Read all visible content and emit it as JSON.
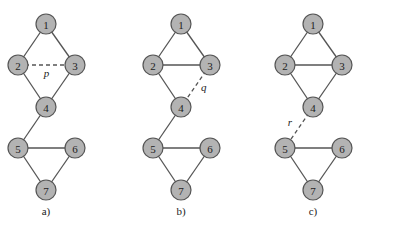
{
  "panels": [
    {
      "label": "a)",
      "offset_x": 0,
      "edges": [
        {
          "from": "1",
          "to": "2",
          "style": "solid"
        },
        {
          "from": "1",
          "to": "3",
          "style": "solid"
        },
        {
          "from": "2",
          "to": "3",
          "style": "dashed",
          "label": "p"
        },
        {
          "from": "2",
          "to": "4",
          "style": "solid"
        },
        {
          "from": "3",
          "to": "4",
          "style": "solid"
        },
        {
          "from": "4",
          "to": "5",
          "style": "solid"
        },
        {
          "from": "5",
          "to": "6",
          "style": "solid"
        },
        {
          "from": "5",
          "to": "7",
          "style": "solid"
        },
        {
          "from": "6",
          "to": "7",
          "style": "solid"
        }
      ]
    },
    {
      "label": "b)",
      "offset_x": 135,
      "edges": [
        {
          "from": "1",
          "to": "2",
          "style": "solid"
        },
        {
          "from": "1",
          "to": "3",
          "style": "solid"
        },
        {
          "from": "2",
          "to": "3",
          "style": "solid"
        },
        {
          "from": "2",
          "to": "4",
          "style": "solid"
        },
        {
          "from": "3",
          "to": "4",
          "style": "dashed",
          "label": "q"
        },
        {
          "from": "4",
          "to": "5",
          "style": "solid"
        },
        {
          "from": "5",
          "to": "6",
          "style": "solid"
        },
        {
          "from": "5",
          "to": "7",
          "style": "solid"
        },
        {
          "from": "6",
          "to": "7",
          "style": "solid"
        }
      ]
    },
    {
      "label": "c)",
      "offset_x": 267,
      "edges": [
        {
          "from": "1",
          "to": "2",
          "style": "solid"
        },
        {
          "from": "1",
          "to": "3",
          "style": "solid"
        },
        {
          "from": "2",
          "to": "3",
          "style": "solid"
        },
        {
          "from": "2",
          "to": "4",
          "style": "solid"
        },
        {
          "from": "3",
          "to": "4",
          "style": "solid"
        },
        {
          "from": "4",
          "to": "5",
          "style": "dashed",
          "label": "r"
        },
        {
          "from": "5",
          "to": "6",
          "style": "solid"
        },
        {
          "from": "5",
          "to": "7",
          "style": "solid"
        },
        {
          "from": "6",
          "to": "7",
          "style": "solid"
        }
      ]
    }
  ],
  "nodes": [
    {
      "id": "1",
      "x": 46,
      "y": 24
    },
    {
      "id": "2",
      "x": 18,
      "y": 65
    },
    {
      "id": "3",
      "x": 75,
      "y": 65
    },
    {
      "id": "4",
      "x": 46,
      "y": 107
    },
    {
      "id": "5",
      "x": 18,
      "y": 148
    },
    {
      "id": "6",
      "x": 75,
      "y": 148
    },
    {
      "id": "7",
      "x": 46,
      "y": 190
    }
  ],
  "node_radius": 10,
  "panel_label_y": 215,
  "colors": {
    "node_fill": "#b3b3b3",
    "node_stroke": "#555555",
    "edge": "#555555",
    "text": "#222222"
  }
}
